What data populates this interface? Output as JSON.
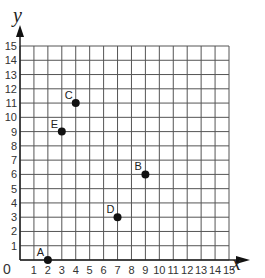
{
  "chart_data": {
    "type": "scatter",
    "title": "",
    "xlabel": "x",
    "ylabel": "y",
    "xlim": [
      0,
      15
    ],
    "ylim": [
      0,
      15
    ],
    "grid": true,
    "origin_label": "0",
    "x_ticks": [
      "1",
      "2",
      "3",
      "4",
      "5",
      "6",
      "7",
      "8",
      "9",
      "10",
      "11",
      "12",
      "13",
      "14",
      "15"
    ],
    "y_ticks": [
      "1",
      "2",
      "3",
      "4",
      "5",
      "6",
      "7",
      "8",
      "9",
      "10",
      "11",
      "12",
      "13",
      "14",
      "15"
    ],
    "points": [
      {
        "label": "A",
        "x": 2,
        "y": 0
      },
      {
        "label": "B",
        "x": 9,
        "y": 6
      },
      {
        "label": "C",
        "x": 4,
        "y": 11
      },
      {
        "label": "D",
        "x": 7,
        "y": 3
      },
      {
        "label": "E",
        "x": 3,
        "y": 9
      }
    ]
  }
}
